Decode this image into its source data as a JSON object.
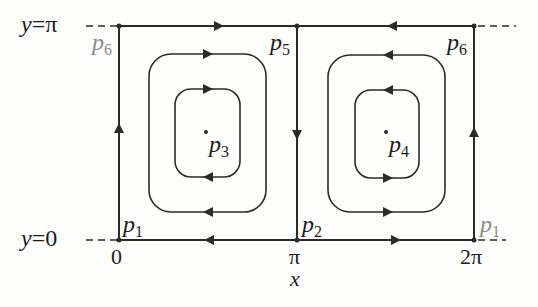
{
  "figure": {
    "type": "phase-portrait",
    "axes": {
      "x_label": "x",
      "x_ticks": [
        "0",
        "π",
        "2π"
      ],
      "y_labels": [
        "y=0",
        "y=π"
      ]
    },
    "points": {
      "p1": {
        "name": "p",
        "sub": "1"
      },
      "p2": {
        "name": "p",
        "sub": "2"
      },
      "p3": {
        "name": "p",
        "sub": "3"
      },
      "p4": {
        "name": "p",
        "sub": "4"
      },
      "p5": {
        "name": "p",
        "sub": "5"
      },
      "p6": {
        "name": "p",
        "sub": "6"
      },
      "p6_ghost": {
        "name": "p",
        "sub": "6"
      },
      "p1_ghost": {
        "name": "p",
        "sub": "1"
      }
    },
    "flow": {
      "top_left_segment": "right",
      "top_right_segment": "left",
      "bottom_left_segment": "left",
      "bottom_right_segment": "right",
      "left_vertical": "up",
      "middle_vertical": "down",
      "right_vertical": "up",
      "left_cycles": "clockwise",
      "right_cycles": "counterclockwise"
    },
    "colors": {
      "ink": "#2a2a2a",
      "ghost_label": "#8a8a8a",
      "background": "#fdfdfb"
    }
  }
}
